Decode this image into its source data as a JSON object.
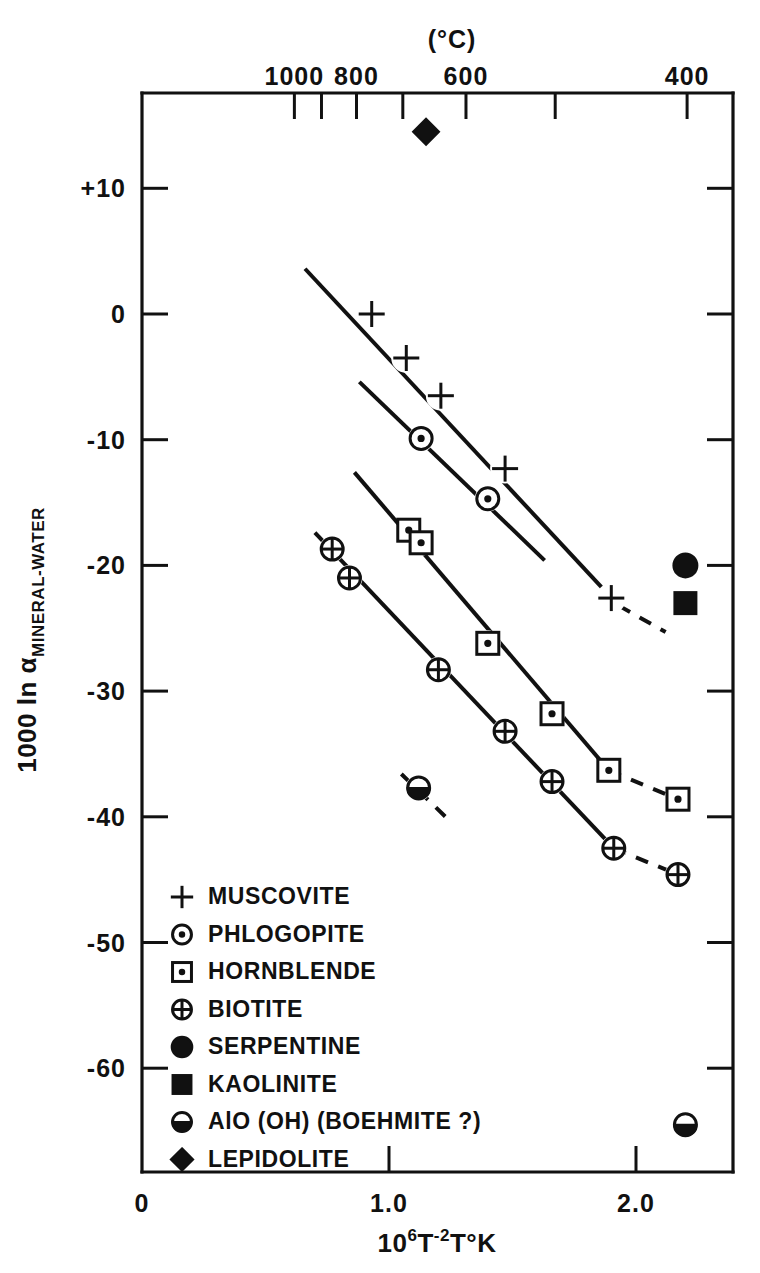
{
  "figure": {
    "top_axis_title": "(°C)",
    "y_axis_title_main": "1000 ln α",
    "y_axis_title_sub": "MINERAL-WATER",
    "x_axis_title_base": "10",
    "x_axis_title_exp1": "6",
    "x_axis_title_t": "T",
    "x_axis_title_exp2": "-2",
    "x_axis_title_tail": "T°K"
  },
  "chart_data": {
    "type": "scatter",
    "title": "",
    "xlabel": "10^6 T^-2  T°K",
    "ylabel": "1000 ln α MINERAL-WATER",
    "xlim": [
      0,
      2.39
    ],
    "ylim": [
      -68,
      17
    ],
    "grid": false,
    "legend_position": "lower-left-inside",
    "x_ticks": [
      "0",
      "1.0",
      "2.0"
    ],
    "x_tick_values": [
      0,
      1.0,
      2.0
    ],
    "y_ticks": [
      "+10",
      "0",
      "-10",
      "-20",
      "-30",
      "-40",
      "-50",
      "-60"
    ],
    "y_tick_values": [
      10,
      0,
      -10,
      -20,
      -30,
      -40,
      -50,
      -60
    ],
    "top_axis_labels": [
      "1000",
      "800",
      "600",
      "400"
    ],
    "top_axis_label_values": [
      1000,
      800,
      600,
      400
    ],
    "top_axis_tick_values": [
      1000,
      900,
      800,
      700,
      600,
      500,
      400
    ],
    "series": [
      {
        "name": "MUSCOVITE",
        "marker": "plus",
        "points": [
          {
            "x": 0.93,
            "y": 0.0
          },
          {
            "x": 1.07,
            "y": -3.5
          },
          {
            "x": 1.21,
            "y": -6.5
          },
          {
            "x": 1.47,
            "y": -12.3
          },
          {
            "x": 1.9,
            "y": -22.6
          }
        ],
        "line_solid": [
          [
            0.66,
            3.6
          ],
          [
            1.93,
            -23.2
          ]
        ],
        "line_dashed": [
          [
            1.93,
            -23.2
          ],
          [
            2.12,
            -25.3
          ]
        ]
      },
      {
        "name": "PHLOGOPITE",
        "marker": "dot-circle",
        "points": [
          {
            "x": 1.13,
            "y": -9.9
          },
          {
            "x": 1.4,
            "y": -14.7
          }
        ],
        "line_solid": [
          [
            0.88,
            -5.4
          ],
          [
            1.63,
            -19.6
          ]
        ],
        "line_dashed": []
      },
      {
        "name": "HORNBLENDE",
        "marker": "dot-square",
        "points": [
          {
            "x": 1.08,
            "y": -17.2
          },
          {
            "x": 1.13,
            "y": -18.2
          },
          {
            "x": 1.4,
            "y": -26.2
          },
          {
            "x": 1.66,
            "y": -31.8
          },
          {
            "x": 1.89,
            "y": -36.3
          },
          {
            "x": 2.17,
            "y": -38.6
          }
        ],
        "line_solid": [
          [
            0.86,
            -12.6
          ],
          [
            1.89,
            -36.3
          ]
        ],
        "line_dashed": [
          [
            1.89,
            -36.3
          ],
          [
            2.17,
            -38.6
          ]
        ]
      },
      {
        "name": "BIOTITE",
        "marker": "cross-circle",
        "points": [
          {
            "x": 0.77,
            "y": -18.7
          },
          {
            "x": 0.84,
            "y": -21.0
          },
          {
            "x": 1.2,
            "y": -28.3
          },
          {
            "x": 1.47,
            "y": -33.2
          },
          {
            "x": 1.66,
            "y": -37.2
          },
          {
            "x": 1.91,
            "y": -42.5
          },
          {
            "x": 2.17,
            "y": -44.6
          }
        ],
        "line_solid": [
          [
            0.7,
            -17.4
          ],
          [
            1.91,
            -42.5
          ]
        ],
        "line_dashed": [
          [
            1.91,
            -42.5
          ],
          [
            2.17,
            -44.6
          ]
        ]
      },
      {
        "name": "SERPENTINE",
        "marker": "filled-circle",
        "points": [
          {
            "x": 2.2,
            "y": -20.0
          }
        ],
        "line_solid": [],
        "line_dashed": []
      },
      {
        "name": "KAOLINITE",
        "marker": "filled-square",
        "points": [
          {
            "x": 2.2,
            "y": -23.0
          }
        ],
        "line_solid": [],
        "line_dashed": []
      },
      {
        "name": "AlO (OH) (BOEHMITE ?)",
        "marker": "half-circle",
        "points": [
          {
            "x": 1.12,
            "y": -37.7
          },
          {
            "x": 2.2,
            "y": -64.5
          }
        ],
        "line_solid": [],
        "line_dashed": [
          [
            1.05,
            -36.6
          ],
          [
            1.25,
            -40.4
          ]
        ]
      },
      {
        "name": "LEPIDOLITE",
        "marker": "filled-diamond",
        "points": [
          {
            "x": 1.15,
            "y": 14.5
          }
        ],
        "line_solid": [],
        "line_dashed": []
      }
    ]
  },
  "legend": {
    "items": [
      {
        "marker": "plus",
        "label": "MUSCOVITE"
      },
      {
        "marker": "dot-circle",
        "label": "PHLOGOPITE"
      },
      {
        "marker": "dot-square",
        "label": "HORNBLENDE"
      },
      {
        "marker": "cross-circle",
        "label": "BIOTITE"
      },
      {
        "marker": "filled-circle",
        "label": "SERPENTINE"
      },
      {
        "marker": "filled-square",
        "label": "KAOLINITE"
      },
      {
        "marker": "half-circle",
        "label": "AlO (OH) (BOEHMITE ?)"
      },
      {
        "marker": "filled-diamond",
        "label": "LEPIDOLITE"
      }
    ]
  },
  "colors": {
    "ink": "#111111",
    "paper": "#ffffff"
  }
}
